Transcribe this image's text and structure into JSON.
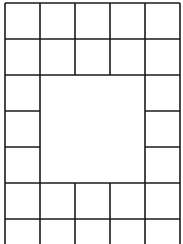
{
  "diagram": {
    "type": "grid-frame",
    "columns": 5,
    "stroke_color": "#1a1a1a",
    "background": "#ffffff",
    "x_lines": [
      5,
      40,
      75,
      110,
      145,
      180
    ],
    "y_lines": [
      3,
      39,
      75,
      111,
      147,
      183,
      219
    ],
    "bottom_open_to": 244,
    "center_region": {
      "x1": 40,
      "y1": 75,
      "x2": 145,
      "y2": 183
    }
  }
}
